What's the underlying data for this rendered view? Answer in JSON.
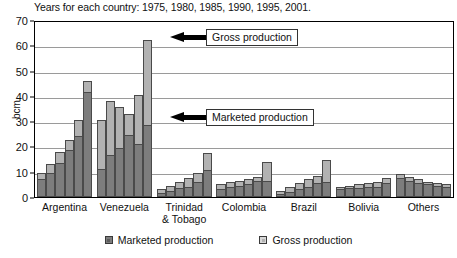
{
  "chart_data": {
    "type": "bar",
    "title": "Years for each country: 1975, 1980, 1985, 1990, 1995, 2001.",
    "xlabel": "",
    "ylabel": "bcm",
    "ylim": [
      0,
      70
    ],
    "yticks": [
      0,
      10,
      20,
      30,
      40,
      50,
      60,
      70
    ],
    "grid": true,
    "stacked": true,
    "legend_position": "bottom",
    "years": [
      1975,
      1980,
      1985,
      1990,
      1995,
      2001
    ],
    "categories": [
      "Argentina",
      "Venezuela",
      "Trinidad & Tobago",
      "Colombia",
      "Brazil",
      "Bolivia",
      "Others"
    ],
    "series": [
      {
        "name": "Marketed production",
        "color": "#7d7d7d",
        "values": [
          [
            7.0,
            9.5,
            13.5,
            18.5,
            24.0,
            41.5
          ],
          [
            11.0,
            16.5,
            19.5,
            24.5,
            21.0,
            28.5
          ],
          [
            1.5,
            2.5,
            3.5,
            4.0,
            6.0,
            10.5
          ],
          [
            3.0,
            4.0,
            4.5,
            5.0,
            6.5,
            6.5
          ],
          [
            1.0,
            2.0,
            3.0,
            4.0,
            5.5,
            6.0
          ],
          [
            3.0,
            3.5,
            3.5,
            4.0,
            4.0,
            5.5
          ],
          [
            7.5,
            6.5,
            5.5,
            5.0,
            4.5,
            4.0
          ]
        ]
      },
      {
        "name": "Gross production",
        "color": "#b2b2b2",
        "values": [
          [
            9.5,
            13.0,
            18.0,
            22.5,
            30.5,
            46.0
          ],
          [
            30.5,
            38.0,
            35.5,
            33.0,
            40.5,
            47.5
          ],
          [
            3.0,
            4.5,
            6.0,
            7.5,
            9.5,
            17.5
          ],
          [
            5.0,
            6.0,
            6.5,
            7.0,
            8.0,
            14.0
          ],
          [
            2.5,
            4.0,
            5.5,
            7.0,
            8.5,
            14.5
          ],
          [
            4.0,
            4.5,
            5.0,
            5.5,
            6.0,
            7.5
          ],
          [
            9.0,
            8.0,
            7.0,
            6.0,
            5.5,
            5.0
          ]
        ]
      }
    ],
    "venezuela_last_gross": 62.0,
    "annotations": [
      {
        "name": "gross-production-callout",
        "label": "Gross production",
        "arrow": "left"
      },
      {
        "name": "marketed-production-callout",
        "label": "Marketed production",
        "arrow": "left"
      }
    ]
  },
  "legend": [
    {
      "label": "Marketed production",
      "swatch": "dark"
    },
    {
      "label": "Gross production",
      "swatch": "light"
    }
  ]
}
